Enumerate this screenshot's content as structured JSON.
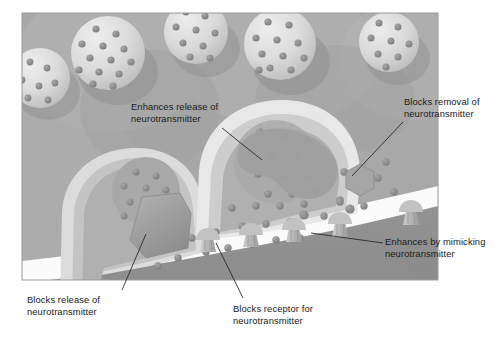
{
  "figure": {
    "panel": {
      "x": 22,
      "y": 13,
      "width": 416,
      "height": 267,
      "background_color": "#a8a8a8",
      "border_color": "#9a9a9a"
    },
    "colors": {
      "page_background": "#ffffff",
      "panel_background": "#a8a8a8",
      "panel_background_light": "#b4b4b4",
      "cleft_white": "#fbfbfb",
      "neuron_body": "#c9c9c9",
      "neuron_membrane": "#e4e4e4",
      "terminal_interior": "#b0b0b0",
      "vesicle_fill": "#dcdcdc",
      "vesicle_shadow": "#8f8f8f",
      "neurotransmitter": "#8c8c8c",
      "neurotransmitter_edge": "#6e6e6e",
      "postsynaptic_cell": "#9a9a9a",
      "postsynaptic_dark": "#8a8a8a",
      "receptor_fill": "#b9b9b9",
      "drug_blocker_fill": "#9d9d9d",
      "drug_hexagon_fill": "#a6a6a6",
      "leader_line": "#2a2a2a",
      "label_text": "#1b1b1b"
    }
  },
  "labels": [
    {
      "id": "enhances-release",
      "text": "Enhances release of\nneurotransmitter",
      "x": 131,
      "y": 101,
      "leader": {
        "x1": 222,
        "y1": 128,
        "x2": 262,
        "y2": 160
      }
    },
    {
      "id": "blocks-removal",
      "text": "Blocks removal of\nneurotransmitter",
      "x": 404,
      "y": 96,
      "leader": {
        "x1": 403,
        "y1": 122,
        "x2": 352,
        "y2": 176
      }
    },
    {
      "id": "blocks-release",
      "text": "Blocks release of\nneurotransmitter",
      "x": 27,
      "y": 294,
      "leader": {
        "x1": 122,
        "y1": 290,
        "x2": 146,
        "y2": 234
      }
    },
    {
      "id": "blocks-receptor",
      "text": "Blocks receptor for\nneurotransmitter",
      "x": 233,
      "y": 303,
      "leader": {
        "x1": 243,
        "y1": 298,
        "x2": 216,
        "y2": 243
      }
    },
    {
      "id": "enhances-mimicking",
      "text": "Enhances by mimicking\nneurotransmitter",
      "x": 385,
      "y": 236,
      "leader": {
        "x1": 383,
        "y1": 243,
        "x2": 311,
        "y2": 233
      }
    }
  ],
  "structures": {
    "vesicles": [
      {
        "id": "vesicle-top-left-edge",
        "cx": 40,
        "cy": 78,
        "r": 30,
        "dots": 7
      },
      {
        "id": "vesicle-top-center",
        "cx": 108,
        "cy": 53,
        "r": 37,
        "dots": 13
      },
      {
        "id": "vesicle-top-right-mid",
        "cx": 196,
        "cy": 32,
        "r": 32,
        "dots": 9
      },
      {
        "id": "vesicle-top-right",
        "cx": 280,
        "cy": 44,
        "r": 36,
        "dots": 11
      },
      {
        "id": "vesicle-far-right",
        "cx": 389,
        "cy": 42,
        "r": 30,
        "dots": 8
      },
      {
        "id": "vesicle-terminal-left",
        "cx": 146,
        "cy": 191,
        "r": 34,
        "dots": 9
      },
      {
        "id": "vesicle-terminal-mid",
        "cx": 276,
        "cy": 162,
        "r": 42,
        "dots": 12
      }
    ],
    "terminals": [
      {
        "id": "presynaptic-terminal-left",
        "label": "left axon terminal"
      },
      {
        "id": "presynaptic-terminal-center",
        "label": "center axon terminal"
      }
    ],
    "receptors": [
      {
        "id": "receptor-1",
        "x": 205,
        "y": 238,
        "state": "blocked"
      },
      {
        "id": "receptor-2",
        "x": 248,
        "y": 232,
        "state": "open"
      },
      {
        "id": "receptor-3",
        "x": 291,
        "y": 228,
        "state": "mimicked"
      },
      {
        "id": "receptor-4",
        "x": 337,
        "y": 223,
        "state": "mimicked"
      },
      {
        "id": "receptor-5",
        "x": 408,
        "y": 211,
        "state": "open"
      }
    ],
    "drugs": [
      {
        "id": "drug-release-blocker",
        "shape": "polygon",
        "location": "left terminal membrane"
      },
      {
        "id": "drug-release-enhancer",
        "shape": "blob",
        "location": "center terminal interior"
      },
      {
        "id": "drug-reuptake-blocker",
        "shape": "hexagon",
        "cx": 360,
        "cy": 180,
        "r": 15
      },
      {
        "id": "drug-receptor-blocker",
        "shape": "cap",
        "location": "receptor 1"
      },
      {
        "id": "drug-agonist-mimic",
        "shape": "cap",
        "location": "receptors 3 and 4"
      }
    ],
    "cleft": {
      "id": "synaptic-cleft",
      "description": "white gap between terminals and postsynaptic membrane"
    },
    "postsynaptic_cell": {
      "id": "postsynaptic-neuron",
      "description": "large dark cell occupying lower right"
    }
  }
}
